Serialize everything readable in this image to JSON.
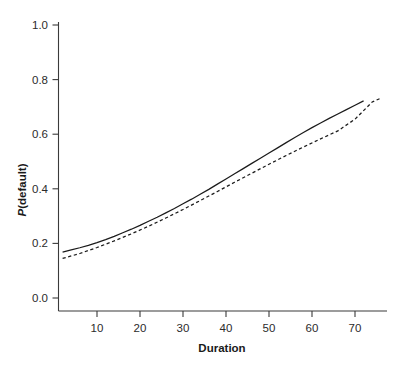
{
  "chart_data": {
    "type": "line",
    "title": "",
    "subtitle": "",
    "xlabel": "Duration",
    "ylabel": "P(default)",
    "ylabel_italic_prefix": "P",
    "ylabel_rest": "(default)",
    "xlim": [
      2,
      76
    ],
    "ylim": [
      0.0,
      1.0
    ],
    "grid": false,
    "legend": "none",
    "x_ticks": [
      10,
      20,
      30,
      40,
      50,
      60,
      70
    ],
    "x_tick_labels": [
      "10",
      "20",
      "30",
      "40",
      "50",
      "60",
      "70"
    ],
    "y_ticks": [
      0.0,
      0.2,
      0.4,
      0.6,
      0.8,
      1.0
    ],
    "y_tick_labels": [
      "0.0",
      "0.2",
      "0.4",
      "0.6",
      "0.8",
      "1.0"
    ],
    "series": [
      {
        "name": "solid-fit",
        "style": "solid",
        "color": "#1b1b1b",
        "x": [
          2,
          4,
          6,
          8,
          10,
          12,
          14,
          16,
          18,
          20,
          22,
          24,
          26,
          28,
          30,
          32,
          34,
          36,
          38,
          40,
          42,
          44,
          46,
          48,
          50,
          52,
          54,
          56,
          58,
          60,
          62,
          64,
          66,
          68,
          70,
          72
        ],
        "y": [
          0.168,
          0.176,
          0.184,
          0.193,
          0.203,
          0.214,
          0.226,
          0.239,
          0.252,
          0.266,
          0.281,
          0.296,
          0.312,
          0.328,
          0.345,
          0.362,
          0.38,
          0.398,
          0.417,
          0.436,
          0.455,
          0.474,
          0.493,
          0.512,
          0.531,
          0.55,
          0.569,
          0.588,
          0.606,
          0.624,
          0.641,
          0.658,
          0.674,
          0.69,
          0.706,
          0.722
        ]
      },
      {
        "name": "dashed-fit",
        "style": "dashed",
        "color": "#1b1b1b",
        "x": [
          2,
          6,
          10,
          14,
          18,
          22,
          26,
          30,
          34,
          38,
          42,
          46,
          50,
          54,
          58,
          62,
          66,
          70,
          74,
          76
        ],
        "y": [
          0.145,
          0.163,
          0.185,
          0.209,
          0.235,
          0.263,
          0.293,
          0.324,
          0.357,
          0.39,
          0.424,
          0.457,
          0.49,
          0.522,
          0.553,
          0.583,
          0.612,
          0.655,
          0.718,
          0.732
        ]
      }
    ],
    "annotations": []
  }
}
